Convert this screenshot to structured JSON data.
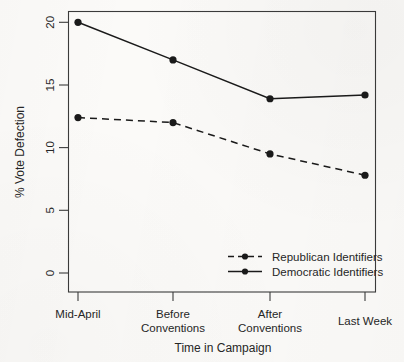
{
  "chart_data": {
    "type": "line",
    "title": "",
    "xlabel": "Time in Campaign",
    "ylabel": "% Vote Defection",
    "categories": [
      "Mid-April",
      "Before Conventions",
      "After Conventions",
      "Last Week"
    ],
    "category_lines": [
      [
        "Mid-April"
      ],
      [
        "Before",
        "Conventions"
      ],
      [
        "After",
        "Conventions"
      ],
      [
        "Last Week"
      ]
    ],
    "series": [
      {
        "name": "Republican Identifiers",
        "values": [
          12.4,
          12.0,
          9.5,
          7.8
        ],
        "line_style": "dashed",
        "marker": "filled-circle",
        "color": "#1a1a1a"
      },
      {
        "name": "Democratic Identifiers",
        "values": [
          20.0,
          17.0,
          13.9,
          14.2
        ],
        "line_style": "solid",
        "marker": "filled-circle",
        "color": "#1a1a1a"
      }
    ],
    "ylim": [
      0,
      21.5
    ],
    "yticks": [
      0,
      5,
      10,
      15,
      20
    ],
    "ytick_labels": [
      "0",
      "5",
      "10",
      "15",
      "20"
    ],
    "ytick_label_rotation": -90,
    "grid": false,
    "legend_position": "bottom-right",
    "legend_entries": [
      {
        "label": "Republican Identifiers",
        "line_style": "dashed"
      },
      {
        "label": "Democratic Identifiers",
        "line_style": "solid"
      }
    ],
    "plot_border": true,
    "background_color": "#fbfaf8",
    "ink_color": "#262626"
  }
}
